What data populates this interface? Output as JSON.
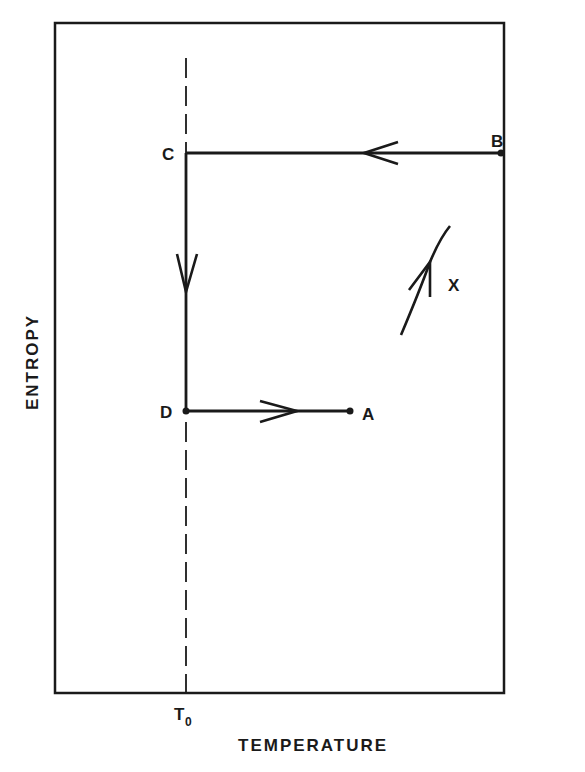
{
  "diagram": {
    "type": "entropy-temperature process diagram",
    "x_axis_label": "TEMPERATURE",
    "y_axis_label": "ENTROPY",
    "reference_line": {
      "label_main": "T",
      "label_sub": "0",
      "style": "dashed vertical"
    },
    "points": {
      "A": "A",
      "B": "B",
      "C": "C",
      "D": "D",
      "X": "X"
    },
    "paths": [
      {
        "from": "B",
        "to": "C",
        "direction": "left",
        "description": "horizontal, constant entropy, cooling to T0"
      },
      {
        "from": "C",
        "to": "D",
        "direction": "down",
        "description": "vertical along T0, entropy decreasing"
      },
      {
        "from": "D",
        "to": "A",
        "direction": "right",
        "description": "horizontal, constant entropy, heating"
      },
      {
        "from": "lower-left",
        "to": "upper-right",
        "label": "X",
        "direction": "up",
        "description": "curved path rising in entropy with temperature"
      }
    ],
    "colors": {
      "ink": "#1a1a1a",
      "background": "#ffffff"
    }
  }
}
